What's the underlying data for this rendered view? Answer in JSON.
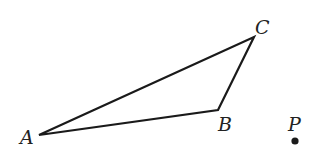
{
  "diagram": {
    "type": "geometry",
    "colors": {
      "stroke": "#1a1a1a",
      "text": "#222222",
      "background": "#ffffff"
    },
    "vertices": {
      "A": {
        "label": "A",
        "x": 39,
        "y": 135
      },
      "B": {
        "label": "B",
        "x": 218,
        "y": 110
      },
      "C": {
        "label": "C",
        "x": 254,
        "y": 37
      }
    },
    "point_p": {
      "label": "P",
      "x": 295,
      "y": 141
    },
    "segments": [
      "AB",
      "BC",
      "CA"
    ]
  }
}
